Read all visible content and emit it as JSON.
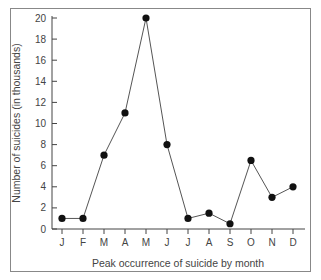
{
  "chart_data": {
    "type": "line",
    "title": "",
    "xlabel": "Peak occurrence of suicide by month",
    "ylabel": "Number of suicides (in thousands)",
    "categories": [
      "J",
      "F",
      "M",
      "A",
      "M",
      "J",
      "J",
      "A",
      "S",
      "O",
      "N",
      "D"
    ],
    "values": [
      1,
      1,
      7,
      11,
      20,
      8,
      1,
      1.5,
      0.5,
      6.5,
      3,
      4
    ],
    "ylim": [
      0,
      20
    ],
    "yticks": [
      0,
      2,
      4,
      6,
      8,
      10,
      12,
      14,
      16,
      18,
      20
    ],
    "grid": false,
    "legend": null,
    "marker": "filled-circle",
    "line_color": "#555555",
    "marker_color": "#111111"
  }
}
